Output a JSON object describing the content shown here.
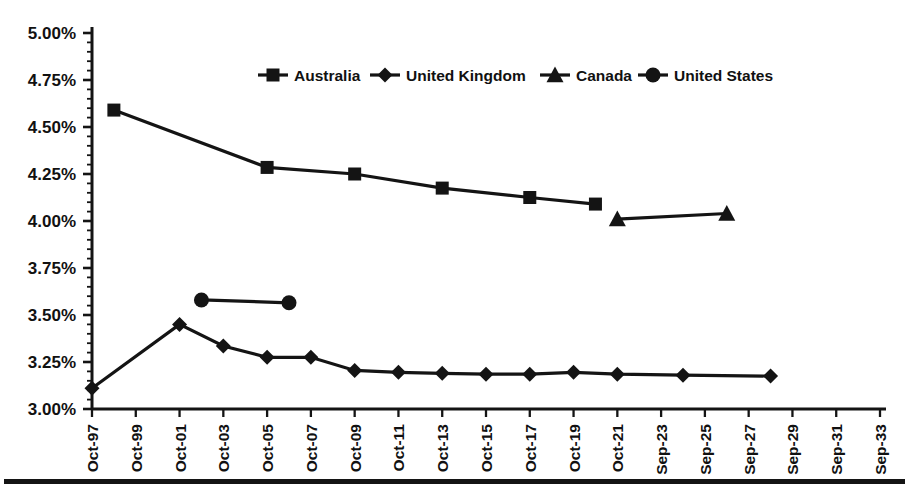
{
  "chart_data": {
    "type": "line",
    "title": "",
    "subtitle": "",
    "xlabel": "",
    "ylabel": "",
    "ylim": [
      3.0,
      5.0
    ],
    "y_tick_step": 0.25,
    "y_unit": "%",
    "grid": false,
    "legend_position": "top-center",
    "y_tick_labels": [
      "5.00%",
      "4.75%",
      "4.50%",
      "4.25%",
      "4.00%",
      "3.75%",
      "3.50%",
      "3.25%",
      "3.00%"
    ],
    "y_tick_values": [
      5.0,
      4.75,
      4.5,
      4.25,
      4.0,
      3.75,
      3.5,
      3.25,
      3.0
    ],
    "x_tick_labels": [
      "Oct-97",
      "Oct-99",
      "Oct-01",
      "Oct-03",
      "Oct-05",
      "Oct-07",
      "Oct-09",
      "Oct-11",
      "Oct-13",
      "Oct-15",
      "Oct-17",
      "Oct-19",
      "Oct-21",
      "Sep-23",
      "Sep-25",
      "Sep-27",
      "Sep-29",
      "Sep-31",
      "Sep-33"
    ],
    "x_tick_values": [
      0,
      2,
      4,
      6,
      8,
      10,
      12,
      14,
      16,
      18,
      20,
      22,
      24,
      26,
      28,
      30,
      32,
      34,
      36
    ],
    "x_range": [
      0,
      36
    ],
    "series": [
      {
        "name": "Australia",
        "marker": "square",
        "x": [
          1,
          8,
          12,
          16,
          20,
          23
        ],
        "values": [
          4.59,
          4.285,
          4.25,
          4.175,
          4.125,
          4.09
        ]
      },
      {
        "name": "United Kingdom",
        "marker": "diamond",
        "x": [
          0,
          4,
          6,
          8,
          10,
          12,
          14,
          16,
          18,
          20,
          22,
          24,
          27,
          31
        ],
        "values": [
          3.11,
          3.45,
          3.335,
          3.275,
          3.275,
          3.205,
          3.195,
          3.19,
          3.185,
          3.185,
          3.195,
          3.185,
          3.18,
          3.175
        ]
      },
      {
        "name": "Canada",
        "marker": "triangle",
        "x": [
          24,
          29
        ],
        "values": [
          4.01,
          4.04
        ]
      },
      {
        "name": "United States",
        "marker": "circle",
        "x": [
          5,
          9
        ],
        "values": [
          3.58,
          3.565
        ]
      }
    ]
  },
  "legend": {
    "entries": [
      {
        "label": "Australia",
        "marker": "square"
      },
      {
        "label": "United Kingdom",
        "marker": "diamond"
      },
      {
        "label": "Canada",
        "marker": "triangle"
      },
      {
        "label": "United States",
        "marker": "circle"
      }
    ]
  },
  "colors": {
    "ink": "#141414",
    "background": "#ffffff"
  }
}
